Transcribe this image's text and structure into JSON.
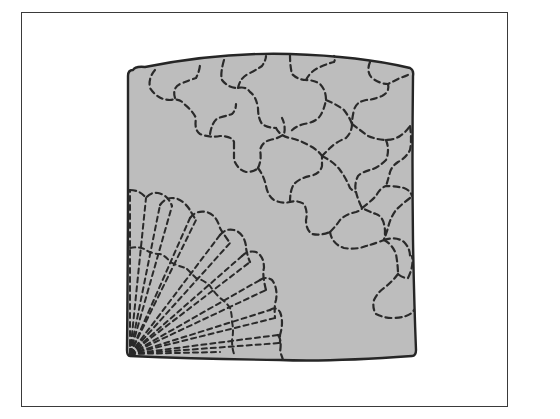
{
  "figure": {
    "colors": {
      "background": "#ffffff",
      "frame_border": "#3a3a3a",
      "block_fill": "#bdbdbd",
      "block_outline": "#262626",
      "stitch_lines": "#2a2a2a"
    },
    "regions": [
      {
        "name": "fan-pattern",
        "position": "bottom-left",
        "petals": 9,
        "style": "dashed radiating fan with scalloped rounded petal tips"
      },
      {
        "name": "interlocking-tile-pattern",
        "position": "top-right diagonal band",
        "style": "dashed interlocking puzzle-like cross shapes"
      }
    ]
  }
}
